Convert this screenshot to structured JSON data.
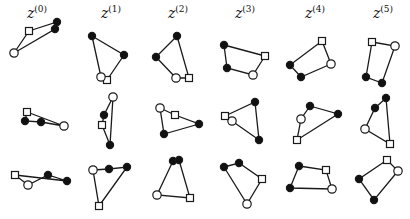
{
  "figure": {
    "columns": [
      {
        "label": "z",
        "sup": "(0)",
        "x": 37
      },
      {
        "label": "z",
        "sup": "(1)",
        "x": 111
      },
      {
        "label": "z",
        "sup": "(2)",
        "x": 178
      },
      {
        "label": "z",
        "sup": "(3)",
        "x": 245
      },
      {
        "label": "z",
        "sup": "(4)",
        "x": 315
      },
      {
        "label": "z",
        "sup": "(5)",
        "x": 383
      }
    ],
    "shapes": [
      [
        [
          "s",
          29,
          31
        ],
        [
          "f",
          57,
          22
        ],
        [
          "f",
          55,
          29
        ],
        [
          "o",
          14,
          53
        ]
      ],
      [
        [
          "f",
          92,
          36
        ],
        [
          "f",
          124,
          55
        ],
        [
          "s",
          107,
          80
        ],
        [
          "o",
          101,
          77
        ]
      ],
      [
        [
          "f",
          177,
          36
        ],
        [
          "s",
          189,
          78
        ],
        [
          "o",
          176,
          78
        ],
        [
          "f",
          156,
          57
        ]
      ],
      [
        [
          "f",
          224,
          45
        ],
        [
          "s",
          265,
          56
        ],
        [
          "o",
          253,
          75
        ],
        [
          "f",
          227,
          68
        ]
      ],
      [
        [
          "s",
          322,
          41
        ],
        [
          "o",
          331,
          64
        ],
        [
          "f",
          301,
          77
        ],
        [
          "f",
          290,
          65
        ]
      ],
      [
        [
          "s",
          372,
          42
        ],
        [
          "o",
          395,
          46
        ],
        [
          "f",
          382,
          83
        ],
        [
          "f",
          366,
          77
        ]
      ],
      [
        [
          "s",
          27,
          112
        ],
        [
          "o",
          64,
          126
        ],
        [
          "f",
          41,
          122
        ],
        [
          "f",
          25,
          121
        ]
      ],
      [
        [
          "o",
          113,
          97
        ],
        [
          "f",
          110,
          145
        ],
        [
          "s",
          102,
          125
        ],
        [
          "f",
          104,
          115
        ]
      ],
      [
        [
          "s",
          175,
          115
        ],
        [
          "f",
          199,
          124
        ],
        [
          "f",
          164,
          134
        ],
        [
          "o",
          160,
          108
        ]
      ],
      [
        [
          "f",
          255,
          102
        ],
        [
          "f",
          259,
          140
        ],
        [
          "o",
          232,
          121
        ],
        [
          "s",
          225,
          116
        ]
      ],
      [
        [
          "f",
          310,
          106
        ],
        [
          "f",
          338,
          114
        ],
        [
          "s",
          297,
          140
        ],
        [
          "o",
          301,
          119
        ]
      ],
      [
        [
          "f",
          386,
          98
        ],
        [
          "s",
          390,
          144
        ],
        [
          "o",
          365,
          129
        ],
        [
          "f",
          375,
          108
        ]
      ],
      [
        [
          "s",
          15,
          175
        ],
        [
          "f",
          67,
          181
        ],
        [
          "f",
          48,
          175
        ],
        [
          "o",
          28,
          185
        ]
      ],
      [
        [
          "o",
          93,
          170
        ],
        [
          "f",
          109,
          169
        ],
        [
          "f",
          127,
          167
        ],
        [
          "s",
          99,
          206
        ]
      ],
      [
        [
          "f",
          173,
          161
        ],
        [
          "f",
          179,
          160
        ],
        [
          "s",
          190,
          198
        ],
        [
          "o",
          157,
          195
        ]
      ],
      [
        [
          "f",
          224,
          167
        ],
        [
          "f",
          239,
          163
        ],
        [
          "s",
          262,
          179
        ],
        [
          "o",
          247,
          204
        ]
      ],
      [
        [
          "f",
          299,
          166
        ],
        [
          "s",
          326,
          170
        ],
        [
          "o",
          332,
          189
        ],
        [
          "f",
          290,
          188
        ]
      ],
      [
        [
          "s",
          387,
          160
        ],
        [
          "o",
          398,
          171
        ],
        [
          "f",
          374,
          200
        ],
        [
          "f",
          359,
          179
        ]
      ]
    ],
    "colors": {
      "stroke": "#1a1a1a",
      "fill": "#111111",
      "open": "#ffffff"
    }
  }
}
